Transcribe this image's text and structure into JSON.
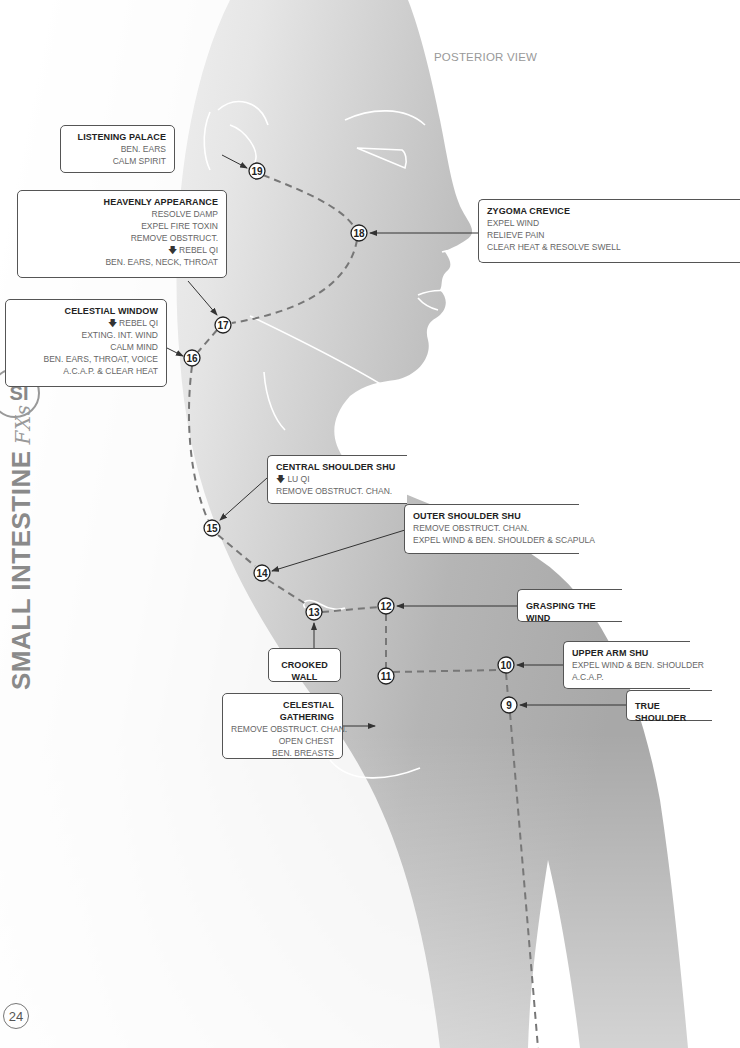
{
  "page": {
    "view_label": "POSTERIOR VIEW",
    "page_number": "24",
    "side_badge": "SI",
    "side_title": "SMALL INTESTINE",
    "side_suffix": "FXs"
  },
  "colors": {
    "silhouette_dark": "#9c9c9c",
    "silhouette_light": "#ffffff",
    "box_border": "#555555",
    "title_text": "#222222",
    "body_text": "#666666",
    "side_text": "#8a8a8a"
  },
  "points": [
    {
      "num": "19",
      "x": 257,
      "y": 171
    },
    {
      "num": "18",
      "x": 359,
      "y": 233
    },
    {
      "num": "17",
      "x": 223,
      "y": 325
    },
    {
      "num": "16",
      "x": 192,
      "y": 358
    },
    {
      "num": "15",
      "x": 212,
      "y": 528
    },
    {
      "num": "14",
      "x": 262,
      "y": 573
    },
    {
      "num": "13",
      "x": 314,
      "y": 612
    },
    {
      "num": "12",
      "x": 386,
      "y": 606
    },
    {
      "num": "11",
      "x": 386,
      "y": 676
    },
    {
      "num": "10",
      "x": 506,
      "y": 665
    },
    {
      "num": "9",
      "x": 509,
      "y": 705
    }
  ],
  "labels": {
    "listening_palace": {
      "title": "LISTENING PALACE",
      "lines": [
        "BEN. EARS",
        "CALM SPIRIT"
      ]
    },
    "heavenly_appearance": {
      "title": "HEAVENLY APPEARANCE",
      "lines": [
        "RESOLVE DAMP",
        "EXPEL FIRE TOXIN",
        "REMOVE OBSTRUCT.",
        "REBEL QI",
        "BEN. EARS, NECK, THROAT"
      ]
    },
    "celestial_window": {
      "title": "CELESTIAL WINDOW",
      "lines": [
        "REBEL QI",
        "EXTING. INT. WIND",
        "CALM MIND",
        "BEN. EARS, THROAT, VOICE",
        "A.C.A.P. & CLEAR HEAT"
      ]
    },
    "zygoma_crevice": {
      "title": "ZYGOMA CREVICE",
      "lines": [
        "EXPEL WIND",
        "RELIEVE PAIN",
        "CLEAR HEAT & RESOLVE SWELL"
      ]
    },
    "central_shoulder_shu": {
      "title": "CENTRAL SHOULDER SHU",
      "lines": [
        "LU QI",
        "REMOVE OBSTRUCT. CHAN."
      ]
    },
    "outer_shoulder_shu": {
      "title": "OUTER SHOULDER SHU",
      "lines": [
        "REMOVE OBSTRUCT. CHAN.",
        "EXPEL WIND & BEN. SHOULDER & SCAPULA"
      ]
    },
    "grasping_the_wind": {
      "title": "GRASPING THE WIND"
    },
    "crooked_wall": {
      "title": "CROOKED WALL"
    },
    "celestial_gathering": {
      "title": "CELESTIAL GATHERING",
      "lines": [
        "REMOVE OBSTRUCT. CHAN.",
        "OPEN CHEST",
        "BEN. BREASTS"
      ]
    },
    "upper_arm_shu": {
      "title": "UPPER ARM SHU",
      "lines": [
        "EXPEL WIND & BEN. SHOULDER",
        "A.C.A.P."
      ]
    },
    "true_shoulder": {
      "title": "TRUE SHOULDER"
    }
  },
  "icons": {
    "down_arrow": "down-arrow-icon"
  }
}
